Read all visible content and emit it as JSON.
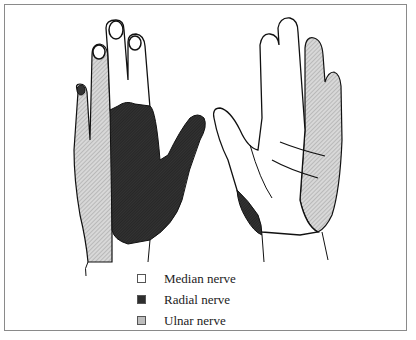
{
  "figure": {
    "views": [
      {
        "name": "dorsal-view",
        "position": "left"
      },
      {
        "name": "palmar-view",
        "position": "right"
      }
    ]
  },
  "legend": {
    "items": [
      {
        "label": "Median nerve",
        "fill": "#ffffff",
        "pattern": "white"
      },
      {
        "label": "Radial nerve",
        "fill": "#2e2e2e",
        "pattern": "dark"
      },
      {
        "label": "Ulnar nerve",
        "fill": "#bdbdbd",
        "pattern": "light-hatched"
      }
    ]
  },
  "colors": {
    "median": "#ffffff",
    "radial": "#2e2e2e",
    "ulnar": "#c4c4c4",
    "outline": "#111111",
    "frame": "#8a8a8a"
  }
}
